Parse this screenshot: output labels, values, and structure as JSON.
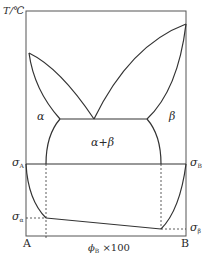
{
  "diagram": {
    "type": "binary phase diagram with surface tension relation",
    "y_axis_label": "T/℃",
    "x_axis_label_main": "ϕ",
    "x_axis_label_sub": "B",
    "x_axis_label_suffix": " ×100",
    "left_component": "A",
    "right_component": "B",
    "regions": {
      "alpha": "α",
      "beta": "β",
      "alpha_beta": "α+β"
    },
    "sigma_labels": {
      "sigma_A_main": "σ",
      "sigma_A_sub": "A",
      "sigma_B_main": "σ",
      "sigma_B_sub": "B",
      "sigma_alpha_main": "σ",
      "sigma_alpha_sub": "α",
      "sigma_beta_main": "σ",
      "sigma_beta_sub": "β"
    },
    "colors": {
      "line": "#333333",
      "background": "#ffffff"
    }
  }
}
